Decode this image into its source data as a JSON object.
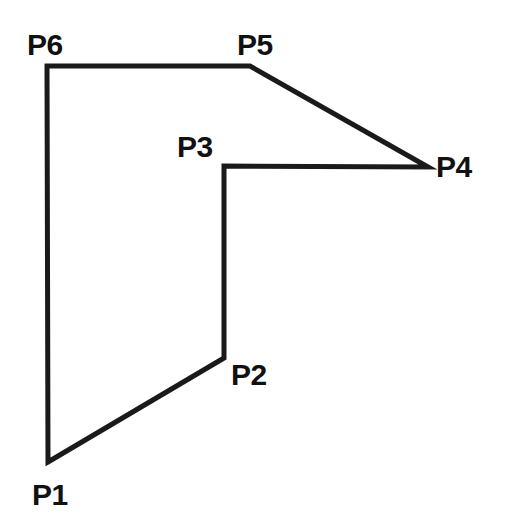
{
  "figure": {
    "kind": "polygon-outline-diagram",
    "background_color": "#FFFFFF",
    "stroke_color": "#1A1A1A",
    "stroke_width": 5,
    "canvas": {
      "width": 505,
      "height": 518
    },
    "closed": true
  },
  "vertices": [
    {
      "id": "P1",
      "label": "P1",
      "x": 48,
      "y": 462,
      "label_x": 32,
      "label_y": 480,
      "label_position": "below-left"
    },
    {
      "id": "P2",
      "label": "P2",
      "x": 224,
      "y": 358,
      "label_x": 231,
      "label_y": 360,
      "label_position": "right"
    },
    {
      "id": "P3",
      "label": "P3",
      "x": 224,
      "y": 166,
      "label_x": 177,
      "label_y": 132,
      "label_position": "above-left"
    },
    {
      "id": "P4",
      "label": "P4",
      "x": 428,
      "y": 167,
      "label_x": 436,
      "label_y": 152,
      "label_position": "right"
    },
    {
      "id": "P5",
      "label": "P5",
      "x": 250,
      "y": 66,
      "label_x": 237,
      "label_y": 30,
      "label_position": "above"
    },
    {
      "id": "P6",
      "label": "P6",
      "x": 47,
      "y": 66,
      "label_x": 27,
      "label_y": 30,
      "label_position": "above-left"
    }
  ],
  "edges": [
    {
      "from": "P1",
      "to": "P2"
    },
    {
      "from": "P2",
      "to": "P3"
    },
    {
      "from": "P3",
      "to": "P4"
    },
    {
      "from": "P4",
      "to": "P5"
    },
    {
      "from": "P5",
      "to": "P6"
    },
    {
      "from": "P6",
      "to": "P1"
    }
  ],
  "path_points": "48,462 224,358 224,166 428,167 250,66 47,66"
}
